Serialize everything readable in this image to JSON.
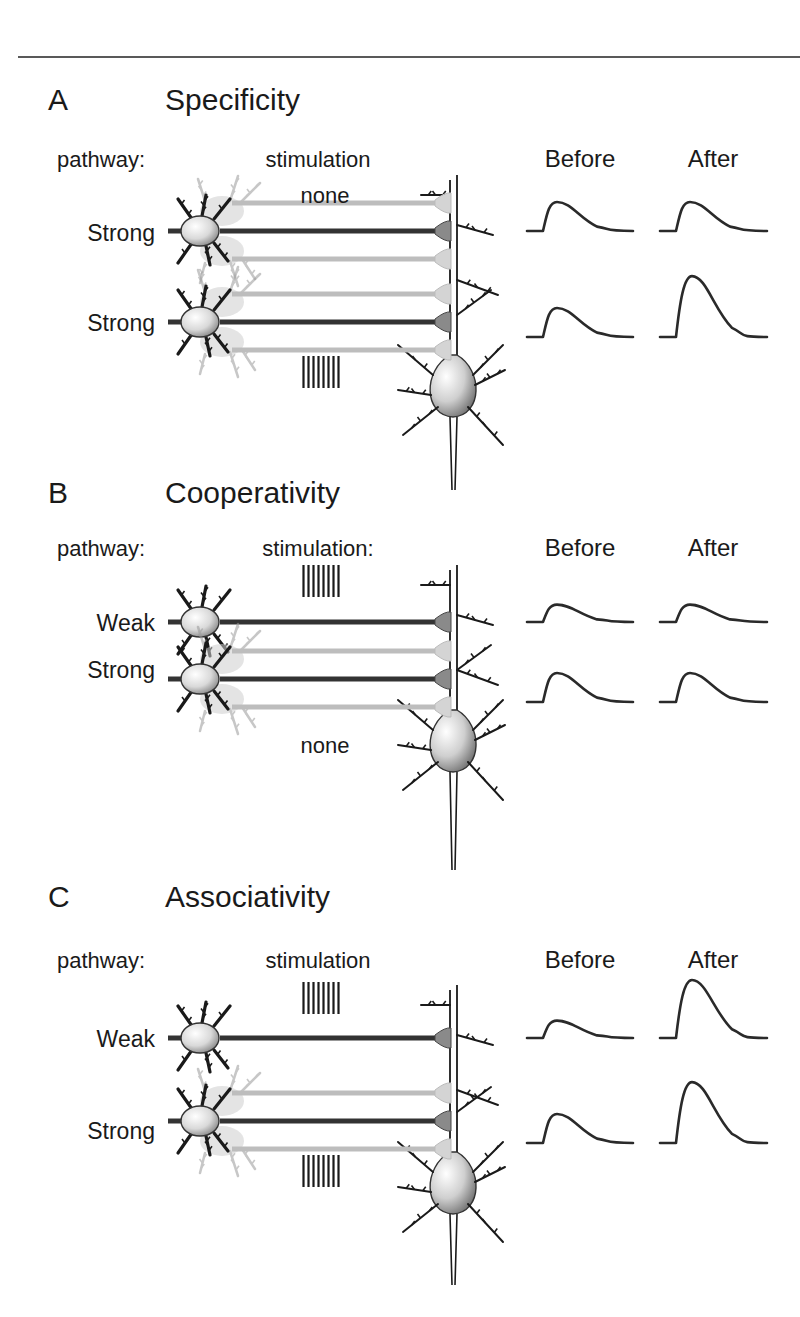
{
  "figure": {
    "panels": [
      {
        "letter": "A",
        "title": "Specificity",
        "pathway_header": "pathway:",
        "stimulation_header": "stimulation",
        "column_headers": [
          "Before",
          "After"
        ],
        "rows": [
          {
            "pathway": "Strong",
            "stimulation": "none",
            "stimulated": false,
            "epsp_before": 1.0,
            "epsp_after": 1.0
          },
          {
            "pathway": "Strong",
            "stimulation": "tetanus",
            "stimulated": true,
            "epsp_before": 1.0,
            "epsp_after": 2.1
          }
        ]
      },
      {
        "letter": "B",
        "title": "Cooperativity",
        "pathway_header": "pathway:",
        "stimulation_header": "stimulation:",
        "column_headers": [
          "Before",
          "After"
        ],
        "rows": [
          {
            "pathway": "Weak",
            "stimulation": "tetanus",
            "stimulated": true,
            "epsp_before": 0.6,
            "epsp_after": 0.6
          },
          {
            "pathway": "Strong",
            "stimulation": "none",
            "stimulated": false,
            "epsp_before": 1.0,
            "epsp_after": 1.0
          }
        ]
      },
      {
        "letter": "C",
        "title": "Associativity",
        "pathway_header": "pathway:",
        "stimulation_header": "stimulation",
        "column_headers": [
          "Before",
          "After"
        ],
        "rows": [
          {
            "pathway": "Weak",
            "stimulation": "tetanus",
            "stimulated": true,
            "epsp_before": 0.6,
            "epsp_after": 2.0
          },
          {
            "pathway": "Strong",
            "stimulation": "tetanus",
            "stimulated": true,
            "epsp_before": 1.0,
            "epsp_after": 2.1
          }
        ]
      }
    ],
    "stimulus_train_pulses": 8,
    "colors": {
      "ink": "#1a1a1a",
      "active_axon": "#333333",
      "inactive_axon": "#bdbdbd",
      "soma_shade": "#9a9a9a"
    }
  }
}
